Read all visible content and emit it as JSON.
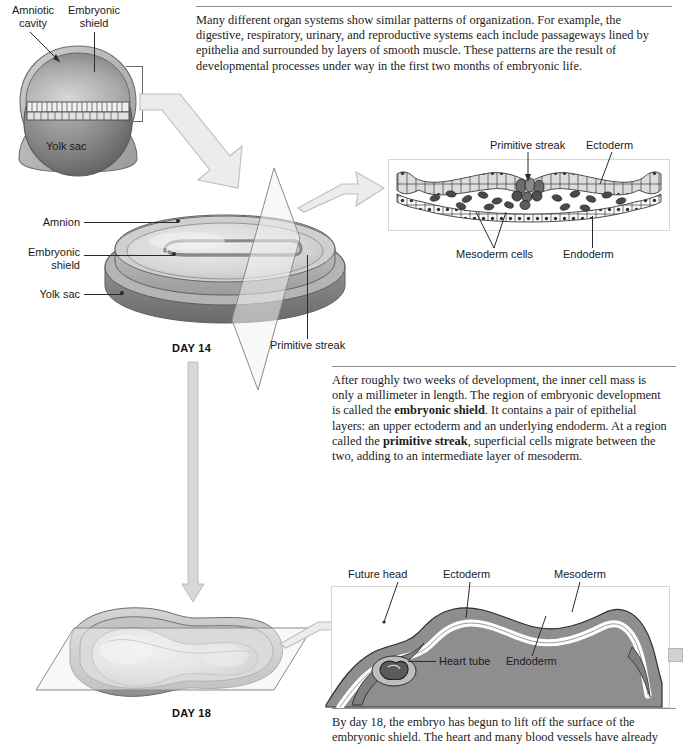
{
  "figure": {
    "colors": {
      "arrow_fill": "#ebebeb",
      "arrow_stroke": "#b3b3b3",
      "leader_line": "#2a2a2a",
      "rule": "#8e8e8e",
      "tissue_grey": "#8c8c8c",
      "tissue_light": "#d9d9d9",
      "panel_border": "#d8d8d8"
    }
  },
  "paragraphs": {
    "intro": {
      "text": "Many different organ systems show similar patterns of organization. For example, the digestive, respiratory, urinary, and reproductive systems each include passageways lined by epithelia and surrounded by layers of smooth muscle. These patterns are the result of developmental processes under way in the first two months of embryonic life."
    },
    "day14": {
      "segments": [
        {
          "text": "After roughly two weeks of development, the inner cell mass is only a millimeter in length. The region of embryonic development is called the ",
          "bold": false
        },
        {
          "text": "embryonic shield",
          "bold": true
        },
        {
          "text": ". It contains a pair of epithelial layers: an upper ectoderm and an underlying endoderm. At a region called the ",
          "bold": false
        },
        {
          "text": "primitive streak",
          "bold": true
        },
        {
          "text": ", superficial cells migrate between the two, adding to an intermediate layer of mesoderm.",
          "bold": false
        }
      ]
    },
    "day18": {
      "text": "By day 18, the embryo has begun to lift off the surface of the embryonic shield. The heart and many blood vessels have already"
    }
  },
  "blastocyst": {
    "labels": {
      "amniotic_cavity_line1": "Amniotic",
      "amniotic_cavity_line2": "cavity",
      "embryonic_shield_line1": "Embryonic",
      "embryonic_shield_line2": "shield",
      "yolk_sac": "Yolk sac"
    }
  },
  "day14_diagram": {
    "day_label": "DAY 14",
    "labels": {
      "amnion": "Amnion",
      "embryonic_shield_line1": "Embryonic",
      "embryonic_shield_line2": "shield",
      "yolk_sac": "Yolk sac",
      "primitive_streak": "Primitive streak"
    }
  },
  "day14_inset": {
    "labels": {
      "primitive_streak": "Primitive streak",
      "ectoderm": "Ectoderm",
      "mesoderm_cells": "Mesoderm cells",
      "endoderm": "Endoderm"
    }
  },
  "day18_diagram": {
    "day_label": "DAY 18"
  },
  "day18_inset": {
    "labels": {
      "future_head": "Future head",
      "ectoderm": "Ectoderm",
      "mesoderm": "Mesoderm",
      "heart_tube": "Heart tube",
      "endoderm": "Endoderm"
    }
  }
}
